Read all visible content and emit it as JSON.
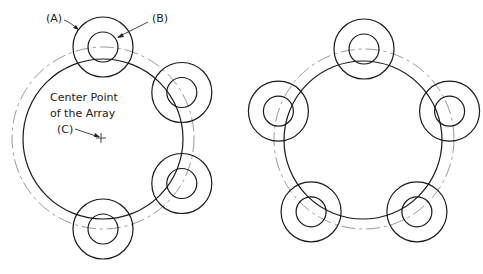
{
  "diagram": {
    "labels": {
      "a": "(A)",
      "b": "(B)",
      "c": "(C)",
      "center_line1": "Center Point",
      "center_line2": "of the Array"
    },
    "left_array": {
      "item_count": 4,
      "item_angles_deg": [
        90,
        30,
        -30,
        -90
      ],
      "description": "Partial polar array (items spread along right side)"
    },
    "right_array": {
      "item_count": 5,
      "item_angles_deg": [
        90,
        18,
        -54,
        -126,
        162
      ],
      "description": "Full 360° polar array"
    },
    "colors": {
      "line": "#1a1a1a",
      "center_line": "#9a9a9a"
    }
  }
}
